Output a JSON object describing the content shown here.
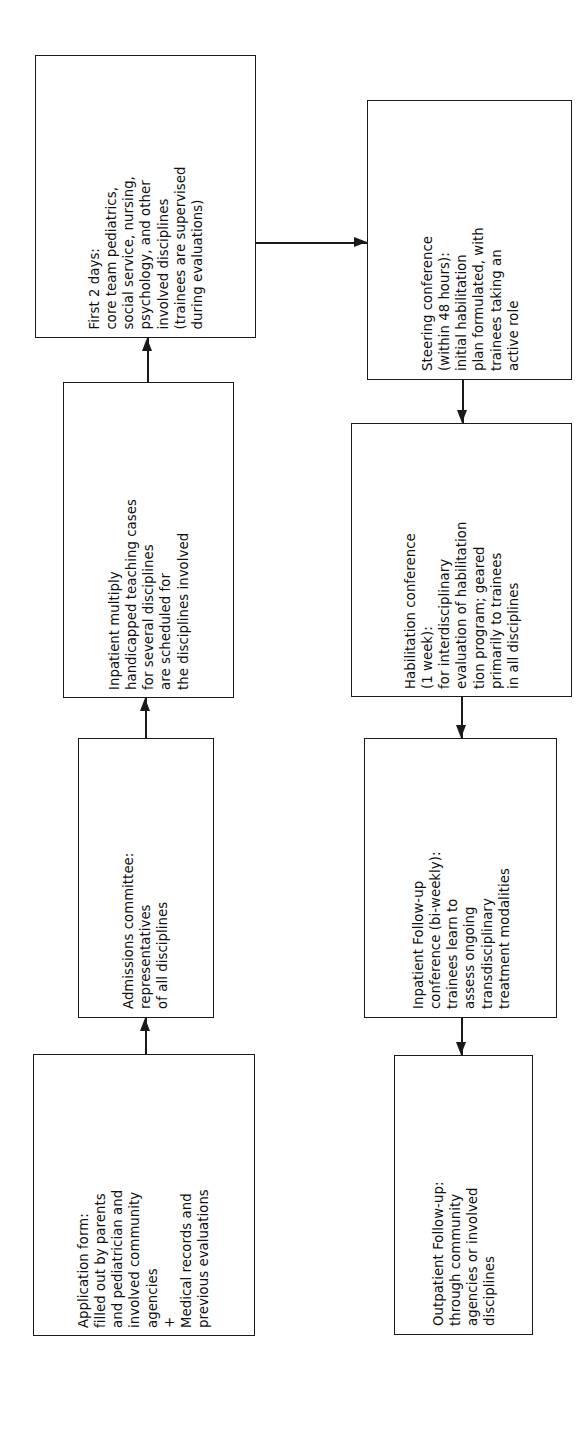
{
  "diagram": {
    "orientation": "text-rotated-90-ccw",
    "ink_color": "#1a1a1a",
    "background_color": "#ffffff",
    "nodes": [
      {
        "id": "first-2-days",
        "name": "first-2-days-box",
        "text": "First 2 days:\ncore team pediatrics,\nsocial service, nursing,\npsychology, and other\ninvolved disciplines\n(trainees are supervised\nduring evaluations)"
      },
      {
        "id": "inpatient-teaching-cases",
        "name": "inpatient-teaching-cases-box",
        "text": "Inpatient multiply\nhandicapped teaching cases\nfor several disciplines\nare scheduled for\nthe disciplines involved"
      },
      {
        "id": "admissions-committee",
        "name": "admissions-committee-box",
        "text": "Admissions committee:\nrepresentatives\nof all disciplines"
      },
      {
        "id": "application-form",
        "name": "application-form-box",
        "text": "Application form:\nfilled out by parents\nand pediatrician and\ninvolved community\nagencies\n+\nMedical records and\nprevious evaluations"
      },
      {
        "id": "steering-conference",
        "name": "steering-conference-box",
        "text": "Steering conference\n(within 48 hours):\ninitial habilitation\nplan formulated, with\ntrainees taking an\nactive role"
      },
      {
        "id": "habilitation-conference",
        "name": "habilitation-conference-box",
        "text": "Habilitation conference\n(1 week):\nfor interdisciplinary\nevaluation of habilitation\ntion program; geared\nprimarily to trainees\nin all disciplines"
      },
      {
        "id": "inpatient-follow-up",
        "name": "inpatient-follow-up-box",
        "text": "Inpatient Follow-up\nconference (bi-weekly):\ntrainees learn to\nassess ongoing\ntransdisciplinary\ntreatment modalities"
      },
      {
        "id": "outpatient-follow-up",
        "name": "outpatient-follow-up-box",
        "text": "Outpatient Follow-up:\nthrough community\nagencies or involved\ndisciplines"
      }
    ],
    "connectors": [
      {
        "id": "c1",
        "from": "application-form",
        "to": "admissions-committee",
        "direction": "up"
      },
      {
        "id": "c2",
        "from": "admissions-committee",
        "to": "inpatient-teaching-cases",
        "direction": "up"
      },
      {
        "id": "c3",
        "from": "inpatient-teaching-cases",
        "to": "first-2-days",
        "direction": "up"
      },
      {
        "id": "c4",
        "from": "first-2-days",
        "to": "steering-conference",
        "direction": "right"
      },
      {
        "id": "c5",
        "from": "steering-conference",
        "to": "habilitation-conference",
        "direction": "down"
      },
      {
        "id": "c6",
        "from": "habilitation-conference",
        "to": "inpatient-follow-up",
        "direction": "down"
      },
      {
        "id": "c7",
        "from": "inpatient-follow-up",
        "to": "outpatient-follow-up",
        "direction": "down"
      }
    ]
  }
}
